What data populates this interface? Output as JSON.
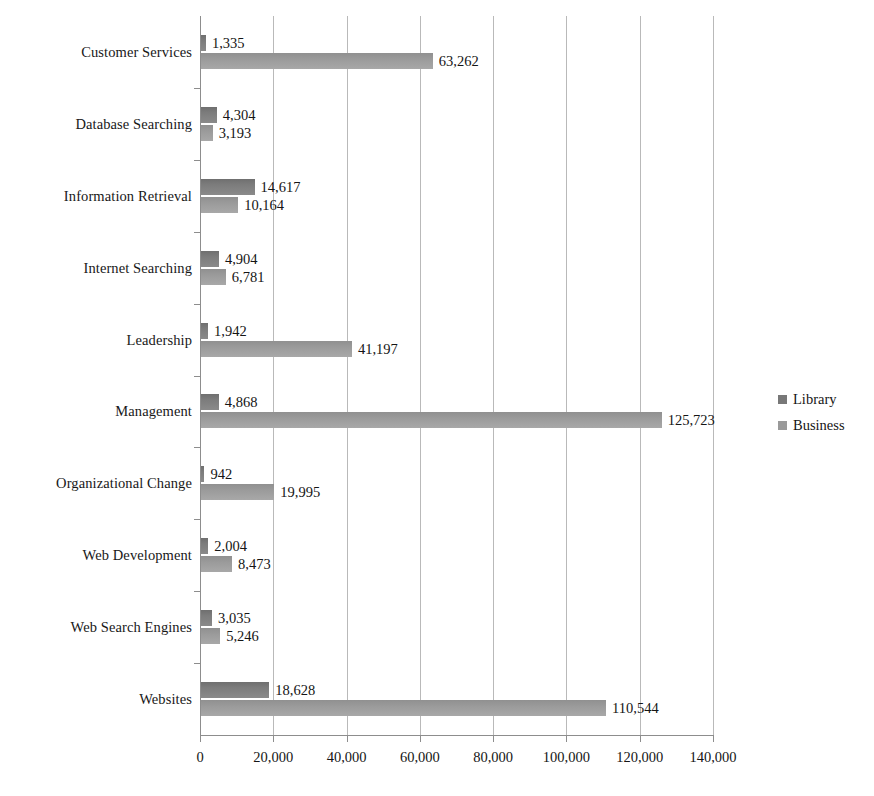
{
  "chart_data": {
    "type": "bar",
    "orientation": "horizontal",
    "title": "",
    "xlabel": "",
    "ylabel": "",
    "xlim": [
      0,
      140000
    ],
    "xticks": [
      "0",
      "20,000",
      "40,000",
      "60,000",
      "80,000",
      "100,000",
      "120,000",
      "140,000"
    ],
    "xtick_values": [
      0,
      20000,
      40000,
      60000,
      80000,
      100000,
      120000,
      140000
    ],
    "grid": "vertical",
    "legend_position": "right",
    "categories": [
      "Customer Services",
      "Database Searching",
      "Information Retrieval",
      "Internet Searching",
      "Leadership",
      "Management",
      "Organizational Change",
      "Web Development",
      "Web Search Engines",
      "Websites"
    ],
    "series": [
      {
        "name": "Library",
        "color": "#7c7c7c",
        "values": [
          1335,
          4304,
          14617,
          4904,
          1942,
          4868,
          942,
          2004,
          3035,
          18628
        ],
        "labels": [
          "1,335",
          "4,304",
          "14,617",
          "4,904",
          "1,942",
          "4,868",
          "942",
          "2,004",
          "3,035",
          "18,628"
        ]
      },
      {
        "name": "Business",
        "color": "#9b9b9b",
        "values": [
          63262,
          3193,
          10164,
          6781,
          41197,
          125723,
          19995,
          8473,
          5246,
          110544
        ],
        "labels": [
          "63,262",
          "3,193",
          "10,164",
          "6,781",
          "41,197",
          "125,723",
          "19,995",
          "8,473",
          "5,246",
          "110,544"
        ]
      }
    ]
  },
  "legend": {
    "items": [
      {
        "label": "Library"
      },
      {
        "label": "Business"
      }
    ]
  }
}
